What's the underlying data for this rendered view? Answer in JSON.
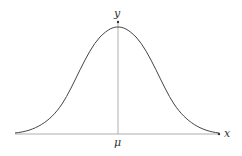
{
  "diagram": {
    "type": "normal-distribution-curve",
    "x_axis_label": "x",
    "y_axis_label": "y",
    "mean_label": "μ",
    "colors": {
      "curve": "#444444",
      "axes": "#888888",
      "mean_line": "#888888",
      "text": "#333333",
      "background": "#ffffff"
    }
  }
}
